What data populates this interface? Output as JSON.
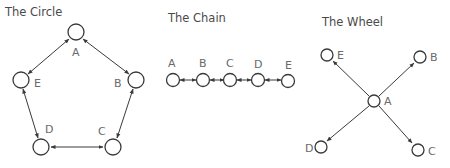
{
  "diagrams": [
    {
      "title": "The Circle",
      "nodes": [
        {
          "id": "A",
          "label": "A"
        },
        {
          "id": "B",
          "label": "B"
        },
        {
          "id": "C",
          "label": "C"
        },
        {
          "id": "D",
          "label": "D"
        },
        {
          "id": "E",
          "label": "E"
        }
      ],
      "edges": [
        [
          "A",
          "B",
          "both"
        ],
        [
          "B",
          "C",
          "both"
        ],
        [
          "C",
          "D",
          "both"
        ],
        [
          "D",
          "E",
          "both"
        ],
        [
          "E",
          "A",
          "both"
        ]
      ]
    },
    {
      "title": "The Chain",
      "nodes": [
        {
          "id": "A",
          "label": "A"
        },
        {
          "id": "B",
          "label": "B"
        },
        {
          "id": "C",
          "label": "C"
        },
        {
          "id": "D",
          "label": "D"
        },
        {
          "id": "E",
          "label": "E"
        }
      ],
      "edges": [
        [
          "A",
          "B",
          "both"
        ],
        [
          "B",
          "C",
          "both"
        ],
        [
          "C",
          "D",
          "both"
        ],
        [
          "D",
          "E",
          "both"
        ]
      ]
    },
    {
      "title": "The Wheel",
      "nodes": [
        {
          "id": "A",
          "label": "A"
        },
        {
          "id": "B",
          "label": "B"
        },
        {
          "id": "C",
          "label": "C"
        },
        {
          "id": "D",
          "label": "D"
        },
        {
          "id": "E",
          "label": "E"
        }
      ],
      "edges": [
        [
          "A",
          "E",
          "forward"
        ],
        [
          "A",
          "B",
          "forward"
        ],
        [
          "A",
          "D",
          "forward"
        ],
        [
          "A",
          "C",
          "forward"
        ]
      ]
    }
  ],
  "colors": {
    "stroke": "#3a3a3a",
    "label": "#6a6a6a",
    "title": "#4a4a4a"
  }
}
